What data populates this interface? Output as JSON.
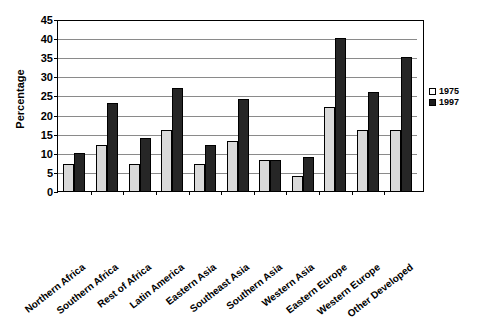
{
  "chart_data": {
    "type": "bar",
    "title": "",
    "xlabel": "",
    "ylabel": "Percentage",
    "ylim": [
      0,
      45
    ],
    "yticks": [
      0,
      5,
      10,
      15,
      20,
      25,
      30,
      35,
      40,
      45
    ],
    "grid": true,
    "legend_position": "right",
    "categories": [
      "Northern Africa",
      "Southern Africa",
      "Rest of Africa",
      "Latin America",
      "Eastern Asia",
      "Southeast Asia",
      "Southern Asia",
      "Western Asia",
      "Eastern Europe",
      "Western Europe",
      "Other Developed"
    ],
    "series": [
      {
        "name": "1975",
        "color": "#d9d9d9",
        "values": [
          7,
          12,
          7,
          16,
          7,
          13,
          8,
          4,
          22,
          16,
          16
        ]
      },
      {
        "name": "1997",
        "color": "#262626",
        "values": [
          10,
          23,
          14,
          27,
          12,
          24,
          8,
          9,
          40,
          26,
          35
        ]
      }
    ]
  },
  "legend": {
    "entries": [
      {
        "label": "1975"
      },
      {
        "label": "1997"
      }
    ]
  }
}
